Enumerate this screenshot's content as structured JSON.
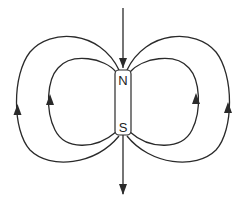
{
  "diagram": {
    "magnet": {
      "north_label": "N",
      "south_label": "S"
    },
    "colors": {
      "line": "#2a2a2a",
      "background": "#ffffff"
    },
    "field_lines": [
      {
        "id": "axis-top",
        "direction": "down-into-N"
      },
      {
        "id": "axis-bottom",
        "direction": "down-out-of-S"
      },
      {
        "id": "left-outer",
        "direction": "up"
      },
      {
        "id": "left-inner",
        "direction": "up"
      },
      {
        "id": "right-inner",
        "direction": "up"
      },
      {
        "id": "right-outer",
        "direction": "up"
      }
    ]
  }
}
